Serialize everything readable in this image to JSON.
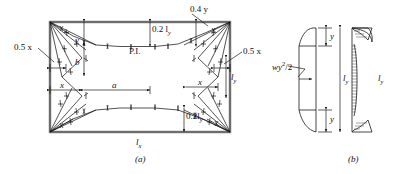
{
  "figure": {
    "title": "",
    "panels": [
      {
        "id": "a",
        "caption": "(a)",
        "description": "yield-line pattern plan of rectangular slab panel"
      },
      {
        "id": "b",
        "caption": "(b)",
        "description": "edge load distribution and moment diagram"
      }
    ]
  },
  "panel_a": {
    "caption": "(a)",
    "labels": {
      "left_half_x": "0.5 x",
      "right_half_x": "0.5 x",
      "top_dim_02ly": "0.2 l",
      "top_dim_02ly_sub": "y",
      "bottom_dim_02ly": "0.2l",
      "bottom_dim_02ly_sub": "y",
      "point_04y": "0.4 y",
      "point_of_inflection": "P.I.",
      "dim_y": "y",
      "dim_b": "b",
      "dim_x_left": "x",
      "dim_x_right": "x",
      "dim_a": "a",
      "side_ly": "l",
      "side_ly_sub": "y",
      "base_lx": "l",
      "base_lx_sub": "x"
    }
  },
  "panel_b": {
    "caption": "(b)",
    "labels": {
      "load_expr": "wy",
      "load_expr_sup": "2",
      "load_expr_tail": "/2",
      "top_y": "y",
      "bottom_y": "y",
      "overall_ly": "l",
      "overall_ly_sub": "y",
      "diagram_ly": "l",
      "diagram_ly_sub": "y"
    }
  },
  "style": {
    "line_color": "#1a1a1a",
    "slab_edge_color": "#8a8a8a",
    "background": "#ffffff",
    "hatch_color": "#333333"
  }
}
